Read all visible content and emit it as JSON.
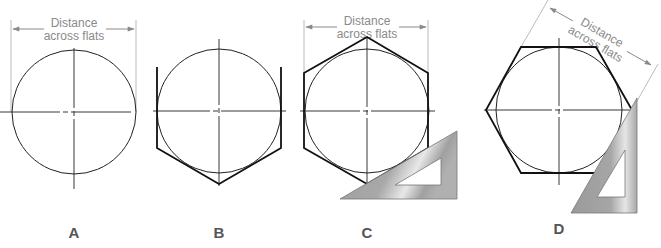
{
  "figure": {
    "dimension_text_line1": "Distance",
    "dimension_text_line2": "across flats",
    "panels": [
      {
        "id": "A",
        "label": "A",
        "description": "circle with center lines and distance across flats dimension"
      },
      {
        "id": "B",
        "label": "B",
        "description": "vertical flats and lower sides of hexagon tangent to circle"
      },
      {
        "id": "C",
        "label": "C",
        "description": "completed hexagon using 30-60 triangle, flats vertical"
      },
      {
        "id": "D",
        "label": "D",
        "description": "hexagon with flats horizontal, triangle at right, rotated dimension"
      }
    ],
    "colors": {
      "line": "#222222",
      "dimension": "#8a8a8a",
      "triangle_fill": "#a8a8a8",
      "triangle_highlight": "#e6e6e6"
    }
  }
}
